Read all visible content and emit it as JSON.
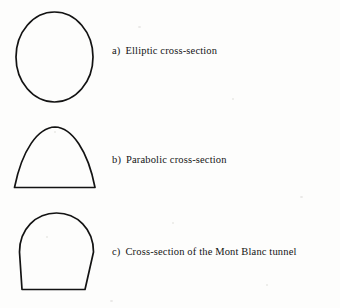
{
  "figure": {
    "background_color": "#fdfdfc",
    "stroke_color": "#131313",
    "text_color": "#141414",
    "items": [
      {
        "marker": "a)",
        "label": "Elliptic cross-section",
        "shape_name": "ellipse",
        "shape_description": "Vertical ellipse outline"
      },
      {
        "marker": "b)",
        "label": "Parabolic cross-section",
        "shape_name": "parabola",
        "shape_description": "Parabolic arch closed by a flat base"
      },
      {
        "marker": "c)",
        "label": "Cross-section of the Mont Blanc tunnel",
        "shape_name": "mont-blanc-arch",
        "shape_description": "Semicircular arch over slightly tapered walls with flat invert"
      }
    ]
  }
}
